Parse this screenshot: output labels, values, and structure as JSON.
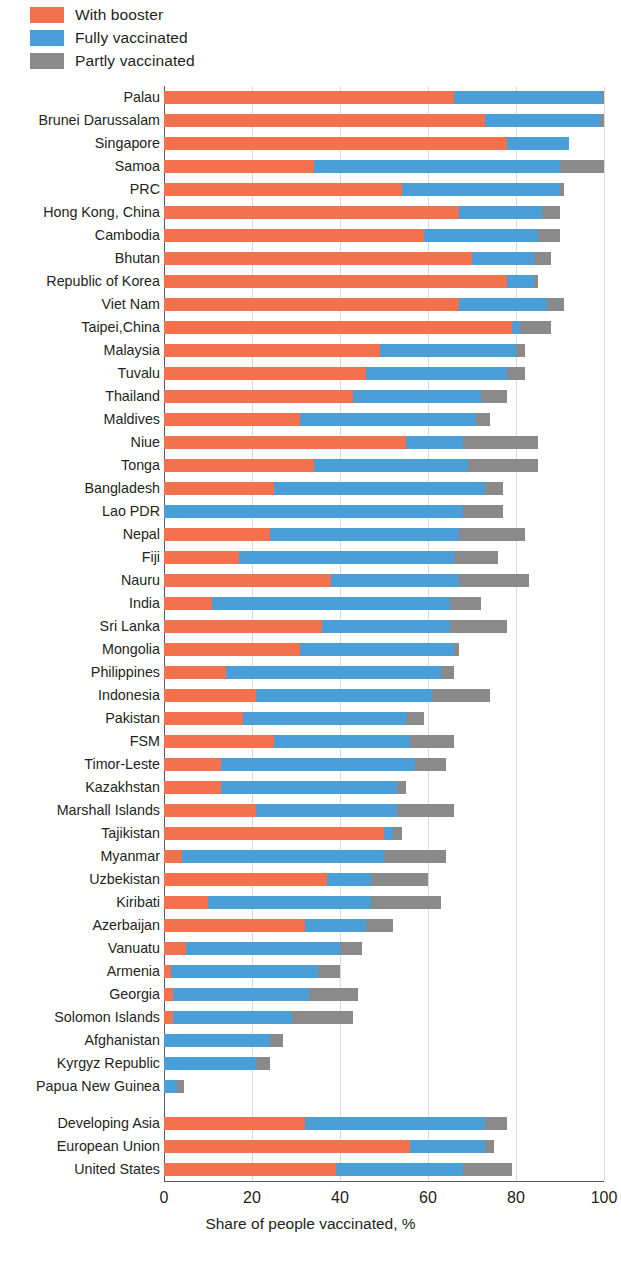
{
  "legend": {
    "items": [
      {
        "label": "With booster",
        "color": "#F4714E",
        "key": "booster"
      },
      {
        "label": "Fully vaccinated",
        "color": "#4A9FD8",
        "key": "fully"
      },
      {
        "label": "Partly vaccinated",
        "color": "#8A8A8A",
        "key": "partly"
      }
    ]
  },
  "axis": {
    "x_title": "Share of people vaccinated, %",
    "ticks": [
      0,
      20,
      40,
      60,
      80,
      100
    ],
    "min": 0,
    "max": 100
  },
  "chart_data": {
    "type": "bar",
    "orientation": "horizontal",
    "stacked": true,
    "title": "",
    "xlabel": "Share of people vaccinated, %",
    "ylabel": "",
    "xlim": [
      0,
      100
    ],
    "grid": "vertical",
    "legend_position": "top-left",
    "series": [
      {
        "name": "With booster",
        "color": "#F4714E",
        "values": [
          66,
          73,
          78,
          34,
          54,
          67,
          59,
          70,
          78,
          67,
          79,
          49,
          46,
          43,
          31,
          55,
          34,
          25,
          0,
          24,
          17,
          38,
          11,
          36,
          31,
          14,
          21,
          18,
          25,
          13,
          13,
          21,
          50,
          4,
          37,
          10,
          32,
          5,
          1.5,
          2,
          2,
          0,
          0,
          0,
          32,
          56,
          39
        ]
      },
      {
        "name": "Fully vaccinated",
        "color": "#4A9FD8",
        "values": [
          33.5,
          26,
          14,
          56,
          36,
          19,
          26,
          14,
          6,
          20,
          2,
          31,
          32,
          29,
          40,
          13,
          35,
          48,
          68,
          43,
          49,
          29,
          54,
          29,
          35,
          49,
          40,
          37,
          31,
          44,
          40,
          32,
          2,
          46,
          10,
          37,
          14,
          35,
          33.5,
          31,
          27,
          24,
          21,
          3,
          41,
          17,
          29
        ]
      },
      {
        "name": "Partly vaccinated",
        "color": "#8A8A8A",
        "values": [
          0.5,
          1,
          0,
          10,
          1,
          4,
          5,
          4,
          1,
          4,
          7,
          2,
          4,
          6,
          3,
          17,
          16,
          4,
          9,
          15,
          10,
          16,
          7,
          13,
          1,
          3,
          13,
          4,
          10,
          7,
          2,
          13,
          2,
          14,
          13,
          16,
          6,
          5,
          5,
          11,
          14,
          3,
          3,
          1.5,
          5,
          2,
          11
        ]
      }
    ],
    "categories": [
      "Palau",
      "Brunei Darussalam",
      "Singapore",
      "Samoa",
      "PRC",
      "Hong Kong, China",
      "Cambodia",
      "Bhutan",
      "Republic of Korea",
      "Viet Nam",
      "Taipei,China",
      "Malaysia",
      "Tuvalu",
      "Thailand",
      "Maldives",
      "Niue",
      "Tonga",
      "Bangladesh",
      "Lao PDR",
      "Nepal",
      "Fiji",
      "Nauru",
      "India",
      "Sri Lanka",
      "Mongolia",
      "Philippines",
      "Indonesia",
      "Pakistan",
      "FSM",
      "Timor-Leste",
      "Kazakhstan",
      "Marshall Islands",
      "Tajikistan",
      "Myanmar",
      "Uzbekistan",
      "Kiribati",
      "Azerbaijan",
      "Vanuatu",
      "Armenia",
      "Georgia",
      "Solomon Islands",
      "Afghanistan",
      "Kyrgyz Republic",
      "Papua New Guinea",
      "Developing Asia",
      "European Union",
      "United States"
    ],
    "group_break_after_index": 43
  }
}
